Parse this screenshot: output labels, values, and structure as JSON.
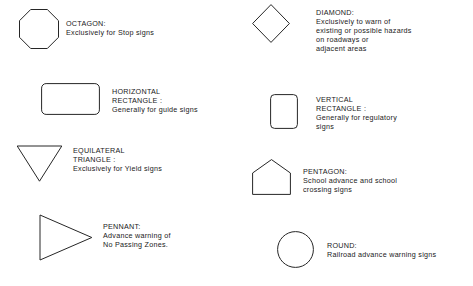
{
  "page": {
    "background_color": "#ffffff",
    "stroke_color": "#262626",
    "text_color": "#1a1a1a"
  },
  "entries": [
    {
      "id": "octagon",
      "shape": "octagon-shape",
      "title": "OCTAGON:",
      "lines": [
        "Exclusively for Stop signs"
      ]
    },
    {
      "id": "diamond",
      "shape": "diamond-shape",
      "title": "DIAMOND:",
      "lines": [
        "Exclusively to warn of",
        "existing or possible hazards",
        "on roadways or",
        "adjacent areas"
      ]
    },
    {
      "id": "horizontal-rectangle",
      "shape": "horizontal-rectangle-shape",
      "title": "HORIZONTAL",
      "lines": [
        "RECTANGLE :",
        "Generally for guide signs"
      ]
    },
    {
      "id": "vertical-rectangle",
      "shape": "vertical-rectangle-shape",
      "title": "VERTICAL",
      "lines": [
        "RECTANGLE :",
        "Generally for regulatory",
        "signs"
      ]
    },
    {
      "id": "equilateral-triangle",
      "shape": "equilateral-triangle-shape",
      "title": "EQUILATERAL",
      "lines": [
        "TRIANGLE :",
        "Exclusively for Yield signs"
      ]
    },
    {
      "id": "pentagon",
      "shape": "pentagon-shape",
      "title": "PENTAGON:",
      "lines": [
        "School advance and school",
        "crossing signs"
      ]
    },
    {
      "id": "pennant",
      "shape": "pennant-shape",
      "title": "PENNANT:",
      "lines": [
        "Advance warning of",
        "No Passing Zones."
      ]
    },
    {
      "id": "round",
      "shape": "round-shape",
      "title": "ROUND:",
      "lines": [
        "Railroad advance warning signs"
      ]
    }
  ]
}
